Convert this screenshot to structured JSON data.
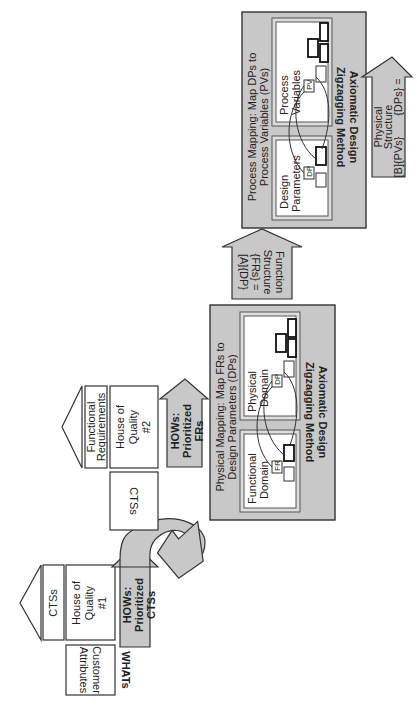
{
  "left_section": {
    "whats_label": "WHATs",
    "customer_attributes": [
      "Customer",
      "Attributes"
    ],
    "hoq1": {
      "lines": [
        "House of",
        "Quality",
        "#1"
      ],
      "top_label": "CTSs"
    },
    "hows_ctss": [
      "HOWs:",
      "Prioritized",
      "CTSs"
    ],
    "ctss_box": "CTSs",
    "hoq2": {
      "lines": [
        "House of",
        "Quality",
        "#2"
      ],
      "top_label": [
        "Functional",
        "Requirements"
      ]
    },
    "hows_frs": [
      "HOWs:",
      "Prioritized",
      "FRs"
    ]
  },
  "physical_mapping": {
    "title": [
      "Physical Mapping: Map FRs to",
      "Design Parameters (DPs)"
    ],
    "method": [
      "Axiomatic Design",
      "Zigzagging Method"
    ],
    "left_domain": {
      "title": [
        "Functional",
        "Domain"
      ],
      "nodes": [
        "FR",
        "FR1",
        "FR2",
        "FR1,1",
        "FR1,2"
      ]
    },
    "right_domain": {
      "title": [
        "Physical",
        "Domain"
      ],
      "nodes": [
        "DP",
        "DP1",
        "DP2",
        "DP1,1",
        "DP1,2"
      ]
    }
  },
  "function_structure": [
    "Function",
    "Structure",
    "{FRs} =",
    "[A]{DP}"
  ],
  "process_mapping": {
    "title": [
      "Process Mapping: Map DPs to",
      "Process Variables (PVs)"
    ],
    "method": [
      "Axiomatic Design",
      "Zigzagging Method"
    ],
    "left_domain": {
      "title": [
        "Design",
        "Parameters"
      ],
      "nodes": [
        "DP",
        "DP1",
        "DP2",
        "DP1,1",
        "DP1,2"
      ]
    },
    "right_domain": {
      "title": [
        "Process",
        "Variables"
      ],
      "nodes": [
        "PV",
        "PV1",
        "PV2",
        "PV1,1",
        "PV1,2"
      ]
    }
  },
  "physical_structure": [
    "Physical",
    "Structure",
    "{DPs} =",
    "[B]{PVs}"
  ],
  "colors": {
    "gray_fill": "#c8c8c8",
    "stroke": "#333333",
    "white": "#ffffff"
  }
}
